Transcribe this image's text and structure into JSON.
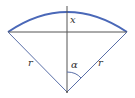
{
  "diagram": {
    "type": "circular-sector",
    "colors": {
      "arc": "#4a68b8",
      "lines": "#555555",
      "label": "#333333"
    },
    "labels": {
      "height": "x",
      "radius_left": "r",
      "radius_right": "r",
      "angle": "α"
    }
  }
}
